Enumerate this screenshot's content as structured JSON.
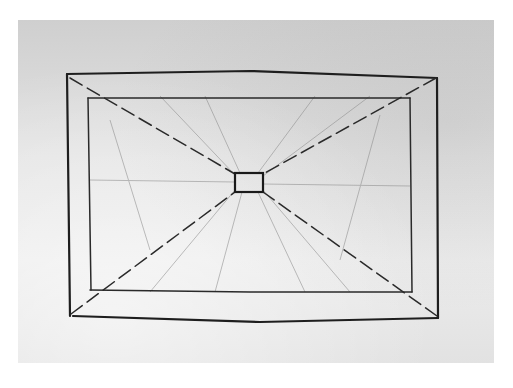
{
  "image": {
    "description": "Pencil/ink sketch on paper of a room in one-point perspective: an outer rectangle, an inner rectangle (back wall frame), and a small central rectangle (vanishing point window), with diagonal lines radiating from the center to the corners.",
    "paper_color": "#dcdcdc",
    "ink_color": "#1e1e1e",
    "faint_ink_color": "#8a8a8a"
  },
  "sketch": {
    "outer_rect": {
      "x1": 68,
      "y1": 74,
      "x2": 437,
      "y2": 318
    },
    "inner_rect": {
      "x1": 90,
      "y1": 98,
      "x2": 410,
      "y2": 292
    },
    "center_box": {
      "x1": 235,
      "y1": 173,
      "x2": 263,
      "y2": 192
    }
  }
}
